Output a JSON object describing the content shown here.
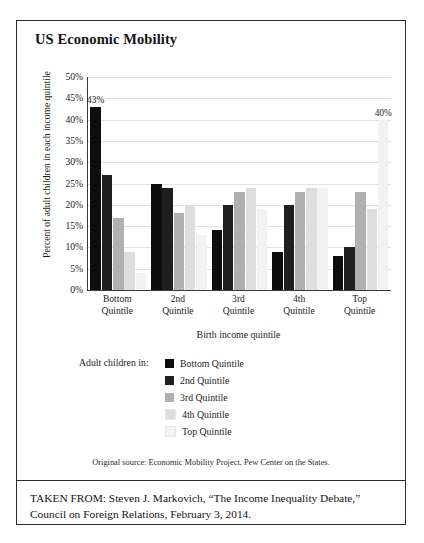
{
  "figure": {
    "title": "US Economic Mobility",
    "source_note": "Original source: Economic Mobility Project, Pew Center on the States.",
    "taken_from": "TAKEN FROM: Steven J. Markovich, “The Income Inequality Debate,” Council on Foreign Relations, February 3, 2014."
  },
  "legend": {
    "caption": "Adult children in:",
    "items": [
      {
        "label": "Bottom Quintile",
        "color": "#0d0d0d"
      },
      {
        "label": "2nd Quintile",
        "color": "#1f1f1f"
      },
      {
        "label": "3rd Quintile",
        "color": "#b0b0b0"
      },
      {
        "label": "4th Quintile",
        "color": "#dedede"
      },
      {
        "label": "Top Quintile",
        "color": "#f2f2f2"
      }
    ]
  },
  "chart_data": {
    "type": "bar",
    "title": "US Economic Mobility",
    "xlabel": "Birth income quintile",
    "ylabel": "Percent of adult children in each income quintile",
    "ylim": [
      0,
      50
    ],
    "ytick_labels": [
      "50%",
      "45%",
      "40%",
      "35%",
      "30%",
      "25%",
      "20%",
      "15%",
      "10%",
      "5%",
      "0%"
    ],
    "ytick_values": [
      50,
      45,
      40,
      35,
      30,
      25,
      20,
      15,
      10,
      5,
      0
    ],
    "grid": true,
    "legend_position": "below-center",
    "categories": [
      "Bottom Quintile",
      "2nd Quintile",
      "3rd Quintile",
      "4th Quintile",
      "Top Quintile"
    ],
    "category_lines": [
      [
        "Bottom",
        "Quintile"
      ],
      [
        "2nd",
        "Quintile"
      ],
      [
        "3rd",
        "Quintile"
      ],
      [
        "4th",
        "Quintile"
      ],
      [
        "Top",
        "Quintile"
      ]
    ],
    "series": [
      {
        "name": "Bottom Quintile",
        "color": "#0d0d0d",
        "values": [
          43,
          25,
          14,
          9,
          8
        ]
      },
      {
        "name": "2nd Quintile",
        "color": "#1f1f1f",
        "values": [
          27,
          24,
          20,
          20,
          10
        ]
      },
      {
        "name": "3rd Quintile",
        "color": "#b0b0b0",
        "values": [
          17,
          18,
          23,
          23,
          23
        ]
      },
      {
        "name": "4th Quintile",
        "color": "#dedede",
        "values": [
          9,
          20,
          24,
          24,
          19
        ]
      },
      {
        "name": "Top Quintile",
        "color": "#f2f2f2",
        "values": [
          4,
          13,
          19,
          24,
          40
        ]
      }
    ],
    "annotations": [
      {
        "text": "43%",
        "series": "Bottom Quintile",
        "category": "Bottom Quintile",
        "value": 43
      },
      {
        "text": "40%",
        "series": "Top Quintile",
        "category": "Top Quintile",
        "value": 40
      }
    ]
  }
}
